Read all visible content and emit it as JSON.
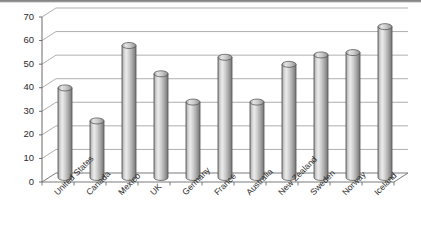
{
  "chart_data": {
    "type": "bar",
    "title": "",
    "subtitle": "",
    "xlabel": "",
    "ylabel": "",
    "ylim": [
      0,
      70
    ],
    "ytick_step": 10,
    "yticks": [
      0,
      10,
      20,
      30,
      40,
      50,
      60,
      70
    ],
    "grid": true,
    "legend": false,
    "style_3d": true,
    "bar_shape": "cylinder",
    "categories": [
      "United States",
      "Canada",
      "Mexico",
      "UK",
      "Germany",
      "France",
      "Australia",
      "New Zealand",
      "Sweden",
      "Norway",
      "Iceland"
    ],
    "values": [
      38,
      24,
      56,
      44,
      32,
      51,
      32,
      48,
      52,
      53,
      64
    ],
    "series": [
      {
        "name": "Series 1",
        "values": [
          38,
          24,
          56,
          44,
          32,
          51,
          32,
          48,
          52,
          53,
          64
        ]
      }
    ]
  },
  "colors": {
    "bar_light": "#e8e8e8",
    "bar_mid": "#b6b6b6",
    "bar_dark": "#7d7d7d",
    "bar_outline": "#4a4a4a",
    "gridline": "#9b9b9b",
    "axis": "#6b6b6b",
    "text": "#2b2b2b",
    "background": "#ffffff",
    "top_rule": "#6f6f6f"
  },
  "axis": {
    "y_tick_labels": [
      "0",
      "10",
      "20",
      "30",
      "40",
      "50",
      "60",
      "70"
    ]
  }
}
